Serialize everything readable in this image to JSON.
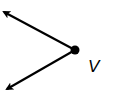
{
  "diagram": {
    "type": "angle",
    "vertex_label": "V",
    "vertex": {
      "x": 75,
      "y": 50
    },
    "rays": [
      {
        "name": "upper-ray",
        "end": {
          "x": 2,
          "y": 11
        }
      },
      {
        "name": "lower-ray",
        "end": {
          "x": 5,
          "y": 91
        }
      }
    ],
    "colors": {
      "stroke": "#000000",
      "background": "#ffffff"
    }
  }
}
